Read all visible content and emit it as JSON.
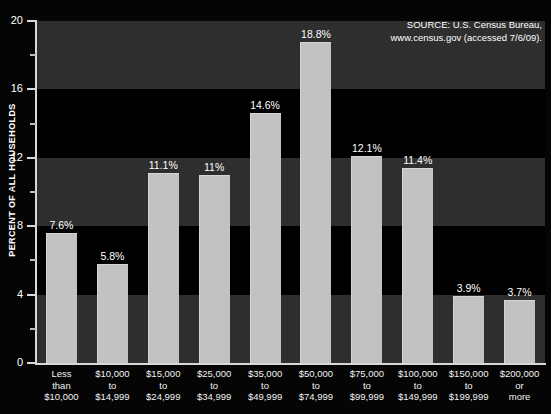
{
  "chart_data": {
    "type": "bar",
    "title": "",
    "subtitle": "",
    "xlabel": "",
    "ylabel": "PERCENT OF ALL HOUSEHOLDS",
    "ylim": [
      0,
      20
    ],
    "yticks": [
      0,
      4,
      8,
      12,
      16,
      20
    ],
    "yticks_minor": [
      2,
      6,
      10,
      14,
      18
    ],
    "grid": false,
    "legend": null,
    "banded_background": true,
    "categories": [
      "Less\nthan\n$10,000",
      "$10,000\nto\n$14,999",
      "$15,000\nto\n$24,999",
      "$25,000\nto\n$34,999",
      "$35,000\nto\n$49,999",
      "$50,000\nto\n$74,999",
      "$75,000\nto\n$99,999",
      "$100,000\nto\n$149,999",
      "$150,000\nto\n$199,999",
      "$200,000\nor\nmore"
    ],
    "values": [
      7.6,
      5.8,
      11.1,
      11.0,
      14.6,
      18.8,
      12.1,
      11.4,
      3.9,
      3.7
    ],
    "value_labels": [
      "7.6%",
      "5.8%",
      "11.1%",
      "11%",
      "14.6%",
      "18.8%",
      "12.1%",
      "11.4%",
      "3.9%",
      "3.7%"
    ],
    "annotations": [
      "SOURCE: U.S. Census Bureau,\nwww.census.gov (accessed 7/6/09)."
    ]
  },
  "source_note": "SOURCE: U.S. Census Bureau,\nwww.census.gov (accessed 7/6/09).",
  "colors": {
    "background": "#000000",
    "band_grey": "#2e2e2e",
    "band_black": "#000000",
    "bar_fill": "#c2c2c2",
    "axis": "#d8d8d8",
    "text": "#ffffff"
  }
}
